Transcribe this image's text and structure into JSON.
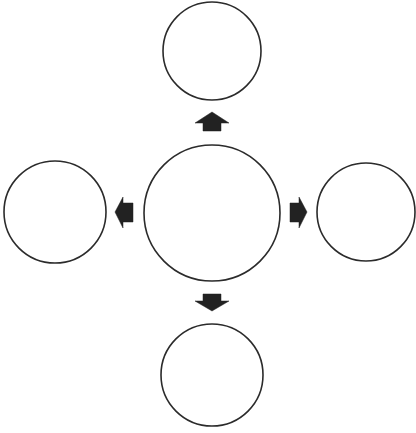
{
  "diagram": {
    "type": "radial-hub-spoke",
    "canvas": {
      "width": 416,
      "height": 433,
      "background": "#ffffff"
    },
    "colors": {
      "stroke": "#2b2b2b",
      "arrow_fill": "#222222",
      "node_fill": "#ffffff"
    },
    "nodes": [
      {
        "id": "center",
        "label": "",
        "cx": 212,
        "cy": 213,
        "r": 68
      },
      {
        "id": "top",
        "label": "",
        "cx": 212,
        "cy": 51,
        "r": 49
      },
      {
        "id": "left",
        "label": "",
        "cx": 55,
        "cy": 212,
        "r": 51
      },
      {
        "id": "right",
        "label": "",
        "cx": 366,
        "cy": 212,
        "r": 49
      },
      {
        "id": "bottom",
        "label": "",
        "cx": 212,
        "cy": 375,
        "r": 51
      }
    ],
    "arrows": [
      {
        "id": "to-top",
        "from": "center",
        "to": "top",
        "direction": "up",
        "icon": "block-arrow-up-icon"
      },
      {
        "id": "to-left",
        "from": "center",
        "to": "left",
        "direction": "left",
        "icon": "block-arrow-left-icon"
      },
      {
        "id": "to-right",
        "from": "center",
        "to": "right",
        "direction": "right",
        "icon": "block-arrow-right-icon"
      },
      {
        "id": "to-bottom",
        "from": "center",
        "to": "bottom",
        "direction": "down",
        "icon": "block-arrow-down-icon"
      }
    ]
  }
}
